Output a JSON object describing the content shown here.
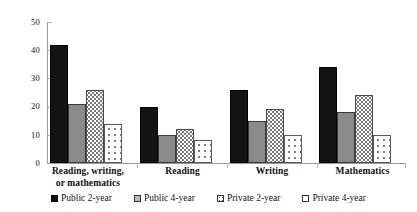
{
  "chart_data": {
    "type": "bar",
    "title": "",
    "xlabel": "",
    "ylabel": "",
    "ylim": [
      0,
      50
    ],
    "yticks": [
      0,
      10,
      20,
      30,
      40,
      50
    ],
    "grid": false,
    "legend_position": "bottom",
    "categories": [
      "Reading, writing, or mathematics",
      "Reading",
      "Writing",
      "Mathematics"
    ],
    "category_lines": [
      [
        "Reading, writing,",
        "or mathematics"
      ],
      [
        "Reading"
      ],
      [
        "Writing"
      ],
      [
        "Mathematics"
      ]
    ],
    "series": [
      {
        "name": "Public 2-year",
        "pattern": "solid-black",
        "values": [
          42,
          20,
          26,
          34
        ]
      },
      {
        "name": "Public 4-year",
        "pattern": "solid-gray",
        "values": [
          21,
          10,
          15,
          18
        ]
      },
      {
        "name": "Private 2-year",
        "pattern": "dense-dots",
        "values": [
          26,
          12,
          19,
          24
        ]
      },
      {
        "name": "Private 4-year",
        "pattern": "sparse-dots",
        "values": [
          14,
          8,
          10,
          10
        ]
      }
    ]
  },
  "legend": {
    "items": [
      {
        "label": "Public 2-year"
      },
      {
        "label": "Public 4-year"
      },
      {
        "label": "Private 2-year"
      },
      {
        "label": "Private 4-year"
      }
    ]
  },
  "axis": {
    "y_tick_labels": [
      "50",
      "40",
      "30",
      "20",
      "10",
      "0"
    ]
  }
}
